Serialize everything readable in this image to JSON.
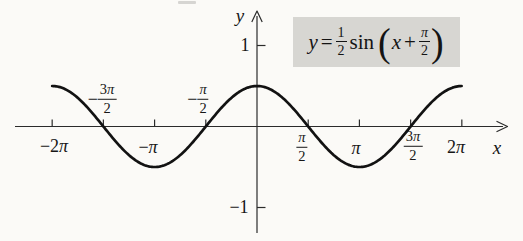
{
  "colors": {
    "background": "#fbfaf7",
    "curve": "#121212",
    "axis": "#2b2b2b",
    "equation_box_bg": "#d7d6d2",
    "text": "#161616"
  },
  "chart_data": {
    "type": "line",
    "equation": {
      "y_var": "y",
      "equals": "=",
      "coef_num": "1",
      "coef_den": "2",
      "func_name": "sin",
      "lparen": "(",
      "arg_var": "x",
      "plus_op": "+",
      "phase_num": "π",
      "phase_den": "2",
      "rparen": ")"
    },
    "function": {
      "form": "y = A·sin(x + φ)",
      "amplitude": 0.5,
      "phase": 1.5707963,
      "period": 6.2831853,
      "equivalent": "y = 0.5·cos(x)"
    },
    "curve_domain": [
      -6.2831853,
      6.2831853
    ],
    "grid": false,
    "legend": "none",
    "x_axis": {
      "label": "x",
      "min": -7.4,
      "max": 7.7,
      "ticks": [
        {
          "value": -6.2831853,
          "display": "−2π",
          "prefix": "−2",
          "pi": "π"
        },
        {
          "value": -4.712389,
          "display": "−3π/2",
          "sign": "−",
          "num_prefix": "3",
          "num_pi": "π",
          "den": "2"
        },
        {
          "value": -3.1415927,
          "display": "−π",
          "prefix": "−",
          "pi": "π"
        },
        {
          "value": -1.5707963,
          "display": "−π/2",
          "sign": "−",
          "num_prefix": "",
          "num_pi": "π",
          "den": "2"
        },
        {
          "value": 1.5707963,
          "display": "π/2",
          "sign": "",
          "num_prefix": "",
          "num_pi": "π",
          "den": "2"
        },
        {
          "value": 3.1415927,
          "display": "π",
          "prefix": "",
          "pi": "π"
        },
        {
          "value": 4.712389,
          "display": "3π/2",
          "sign": "",
          "num_prefix": "3",
          "num_pi": "π",
          "den": "2"
        },
        {
          "value": 6.2831853,
          "display": "2π",
          "prefix": "2",
          "pi": "π"
        }
      ]
    },
    "y_axis": {
      "label": "y",
      "min": -1.4,
      "max": 1.45,
      "ticks": [
        {
          "value": 1,
          "label": "1"
        },
        {
          "value": -1,
          "label": "−1"
        }
      ]
    }
  }
}
